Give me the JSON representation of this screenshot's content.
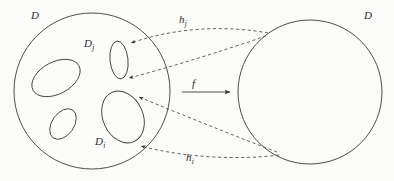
{
  "figure": {
    "type": "mathematical-diagram",
    "stroke_color": "#3a3a3a",
    "dashed_color": "#4a4a4a",
    "background_color": "#fbfbfa"
  },
  "labels": {
    "domain_left": "D",
    "domain_right": "D",
    "subdomain_j": "D",
    "subdomain_j_sub": "j",
    "subdomain_i": "D",
    "subdomain_i_sub": "i",
    "map_j": "h",
    "map_j_sub": "j",
    "map_i": "h",
    "map_i_sub": "i",
    "map_f": "f"
  },
  "shapes": {
    "left_disk": {
      "cx": 92,
      "cy": 91,
      "r": 78
    },
    "right_disk": {
      "cx": 310,
      "cy": 92,
      "r": 72
    },
    "inner_ellipses": [
      {
        "name": "blob-upper-left",
        "cx": 56,
        "cy": 78,
        "rx": 26,
        "ry": 16,
        "rotate": -28
      },
      {
        "name": "blob-lower-left",
        "cx": 63,
        "cy": 124,
        "rx": 17,
        "ry": 11,
        "rotate": -55
      },
      {
        "name": "subdomain-j",
        "cx": 119,
        "cy": 60,
        "rx": 9,
        "ry": 19,
        "rotate": -6
      },
      {
        "name": "subdomain-i",
        "cx": 123,
        "cy": 117,
        "rx": 20,
        "ry": 27,
        "rotate": -24
      }
    ],
    "arrow_f": {
      "x1": 182,
      "y1": 92,
      "x2": 232,
      "y2": 92
    }
  }
}
